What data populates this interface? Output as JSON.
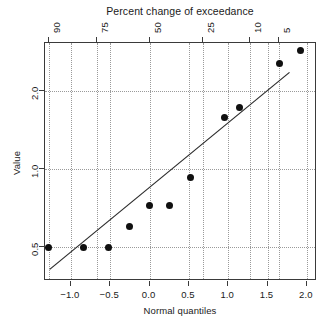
{
  "chart_data": {
    "type": "scatter",
    "title": "Percent change of exceedance",
    "xlabel": "Normal quantiles",
    "ylabel": "Value",
    "grid": true,
    "legend": null,
    "xlim": [
      -1.33,
      2.13
    ],
    "ylim_log": [
      0.37,
      3.05
    ],
    "yscale": "log",
    "xticks": [
      -1.0,
      -0.5,
      0.0,
      0.5,
      1.0,
      1.5,
      2.0
    ],
    "xticklabels": [
      "−1.0",
      "−0.5",
      "0.0",
      "0.5",
      "1.0",
      "1.5",
      "2.0"
    ],
    "yticks": [
      0.5,
      1.0,
      2.0
    ],
    "yticklabels": [
      "0.5",
      "1.0",
      "2.0"
    ],
    "top_axis": {
      "label": "Percent change of exceedance",
      "ticks": [
        -1.282,
        -0.674,
        0.0,
        0.674,
        1.282,
        1.645
      ],
      "ticklabels": [
        "90",
        "75",
        "50",
        "25",
        "10",
        "5"
      ]
    },
    "points": [
      {
        "x": -1.28,
        "y": 0.5
      },
      {
        "x": -0.84,
        "y": 0.5
      },
      {
        "x": -0.52,
        "y": 0.5
      },
      {
        "x": -0.25,
        "y": 0.6
      },
      {
        "x": 0.0,
        "y": 0.72
      },
      {
        "x": 0.25,
        "y": 0.72
      },
      {
        "x": 0.52,
        "y": 0.93
      },
      {
        "x": 0.95,
        "y": 1.58
      },
      {
        "x": 1.14,
        "y": 1.72
      },
      {
        "x": 1.65,
        "y": 2.55
      },
      {
        "x": 1.92,
        "y": 2.85
      }
    ],
    "reference_line": {
      "x0": -1.27,
      "y0": 0.41,
      "x1": 1.78,
      "y1": 2.35
    },
    "colors": {
      "point": "#101010",
      "line": "#2b2b2b",
      "grid": "#9a9a9a",
      "frame": "#3a3a3a"
    }
  }
}
